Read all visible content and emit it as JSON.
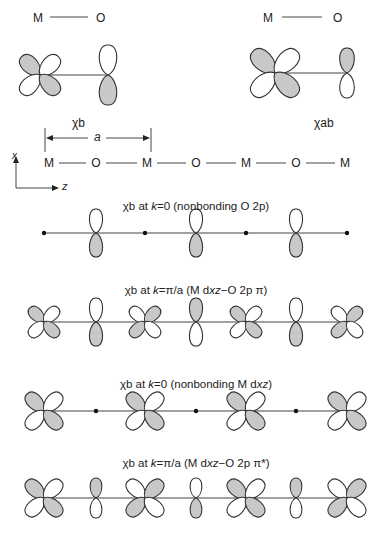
{
  "colors": {
    "shade": "#c8c8c8",
    "stroke": "#333333",
    "line": "#444444"
  },
  "top_left": {
    "bond_label_m": "M",
    "bond_label_o": "O",
    "name": "χb",
    "m_signs": [
      "+",
      "-",
      "-",
      "+"
    ],
    "o_sign": "bottom-shaded"
  },
  "top_right": {
    "bond_label_m": "M",
    "bond_label_o": "O",
    "name": "χab",
    "m_signs": [
      "+",
      "-",
      "-",
      "+"
    ],
    "o_sign": "top-shaded"
  },
  "lattice": {
    "label": "a"
  },
  "axes": {
    "x": "x",
    "z": "z"
  },
  "chain": [
    "M",
    "O",
    "M",
    "O",
    "M",
    "O",
    "M"
  ],
  "rows": [
    {
      "caption": "χb at k=0 (nonbonding O 2p)",
      "caption_parts": {
        "pre": "χb at ",
        "k": "k",
        "post": "=0 (nonbonding O 2p)"
      },
      "sites": [
        {
          "type": "dot"
        },
        {
          "type": "p",
          "shade": "bottom"
        },
        {
          "type": "dot"
        },
        {
          "type": "p",
          "shade": "bottom"
        },
        {
          "type": "dot"
        },
        {
          "type": "p",
          "shade": "bottom"
        },
        {
          "type": "dot"
        }
      ]
    },
    {
      "caption": "χb at k=π/a (M dxz−O 2p π)",
      "caption_parts": {
        "pre": "χb at ",
        "k": "k",
        "post": "=π/a (M d",
        "xz": "xz",
        "tail": "−O 2p π)"
      },
      "sites": [
        {
          "type": "d",
          "shade": "tl-br"
        },
        {
          "type": "p",
          "shade": "bottom"
        },
        {
          "type": "d",
          "shade": "tr-bl"
        },
        {
          "type": "p",
          "shade": "top"
        },
        {
          "type": "d",
          "shade": "tl-br"
        },
        {
          "type": "p",
          "shade": "bottom"
        },
        {
          "type": "d",
          "shade": "tr-bl"
        }
      ]
    },
    {
      "caption": "χb at k=0 (nonbonding M dxz)",
      "caption_parts": {
        "pre": "χb at ",
        "k": "k",
        "post": "=0 (nonbonding M d",
        "xz": "xz",
        "tail": ")"
      },
      "sites": [
        {
          "type": "d",
          "shade": "tl-br"
        },
        {
          "type": "dot"
        },
        {
          "type": "d",
          "shade": "tl-br"
        },
        {
          "type": "dot"
        },
        {
          "type": "d",
          "shade": "tl-br"
        },
        {
          "type": "dot"
        },
        {
          "type": "d",
          "shade": "tl-br"
        }
      ]
    },
    {
      "caption": "χb at k=π/a (M dxz−O 2p π*)",
      "caption_parts": {
        "pre": "χb at ",
        "k": "k",
        "post": "=π/a (M d",
        "xz": "xz",
        "tail": "−O 2p π*)"
      },
      "sites": [
        {
          "type": "d",
          "shade": "tl-br"
        },
        {
          "type": "p",
          "shade": "top"
        },
        {
          "type": "d",
          "shade": "tr-bl"
        },
        {
          "type": "p",
          "shade": "bottom"
        },
        {
          "type": "d",
          "shade": "tl-br"
        },
        {
          "type": "p",
          "shade": "top"
        },
        {
          "type": "d",
          "shade": "tr-bl"
        }
      ]
    }
  ]
}
